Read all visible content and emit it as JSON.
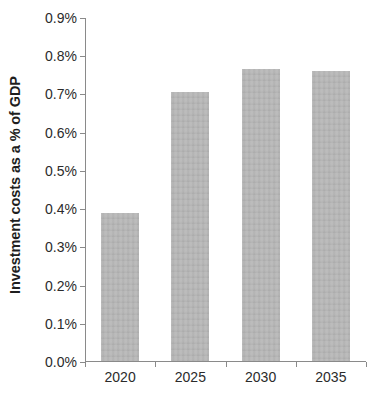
{
  "chart_data": {
    "type": "bar",
    "title": "",
    "subtitle": "",
    "xlabel": "",
    "ylabel": "Investment costs as a % of GDP",
    "categories": [
      "2020",
      "2025",
      "2030",
      "2035"
    ],
    "values": [
      0.387,
      0.703,
      0.763,
      0.76
    ],
    "value_unit": "percent",
    "series": [
      {
        "name": "Investment costs as a % of GDP",
        "values": [
          0.387,
          0.703,
          0.763,
          0.76
        ]
      }
    ],
    "ylim": [
      0.0,
      0.9
    ],
    "ytick_values": [
      0.0,
      0.1,
      0.2,
      0.3,
      0.4,
      0.5,
      0.6,
      0.7,
      0.8,
      0.9
    ],
    "ytick_labels": [
      "0.0%",
      "0.1%",
      "0.2%",
      "0.3%",
      "0.4%",
      "0.5%",
      "0.6%",
      "0.7%",
      "0.8%",
      "0.9%"
    ],
    "grid": false,
    "legend": false,
    "legend_position": "none",
    "annotations": [],
    "colors": {
      "bar_fill": "#b4b4b4",
      "axis_line": "#8a8a8a",
      "text": "#2b2b2b",
      "background": "#ffffff"
    }
  }
}
